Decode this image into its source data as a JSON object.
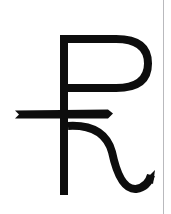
{
  "canvas": {
    "width": 171,
    "height": 214,
    "background_color": "#ffffff",
    "ink_color": "#0d0d0d"
  },
  "artwork": {
    "name": "currency-symbol-glyph",
    "description": "Hand-drawn rupee-like currency symbol: P-shaped bowl on a vertical stem, crossed by a horizontal bar, with a curled h-shaped tail.",
    "caption": "Rupee-like currency symbol",
    "stroke_color": "#0d0d0d",
    "stroke_width": 8
  },
  "strokes": {
    "stem": {
      "name": "vertical-stem",
      "x": 64,
      "top_y": 35,
      "bottom_y": 195,
      "width": 8
    },
    "bowl": {
      "name": "p-bowl",
      "corner_x": 60,
      "top_y": 39,
      "right_x": 148,
      "close_y": 88,
      "path": "M 64 39 L 116 39 Q 148 39 148 63.5 Q 148 88 116 88 L 64 88"
    },
    "crossbar": {
      "name": "horizontal-crossbar",
      "left_x": 15,
      "right_x": 113,
      "y": 114,
      "thickness": 8
    },
    "tail": {
      "name": "curled-tail",
      "start_x": 68,
      "start_y": 126,
      "bottom_y": 190,
      "terminal_x": 152,
      "path": "M 68 126 Q 104 124 112 152 Q 120 190 136 189 Q 148 187 151 175"
    }
  },
  "scan_edge": {
    "name": "scan-edge-line",
    "x": 163,
    "color": "#b9b9bd"
  }
}
